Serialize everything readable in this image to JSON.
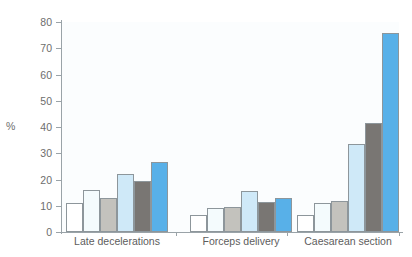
{
  "chart_data": {
    "type": "bar",
    "title": "",
    "subtitle": "",
    "xlabel": "",
    "ylabel": "%",
    "ylim": [
      0,
      80
    ],
    "yticks": [
      0,
      10,
      20,
      30,
      40,
      50,
      60,
      70,
      80
    ],
    "ytick_labels": [
      "0",
      "10",
      "20",
      "30",
      "40",
      "50",
      "60",
      "70",
      "80"
    ],
    "grid": false,
    "legend": "none",
    "categories": [
      "Late decelerations",
      "Forceps delivery",
      "Caesarean section"
    ],
    "series": [
      {
        "name": "series-1",
        "color": "#ffffff",
        "values": [
          11.0,
          6.5,
          6.5
        ]
      },
      {
        "name": "series-2",
        "color": "#f4fbfd",
        "values": [
          16.0,
          9.0,
          11.0
        ]
      },
      {
        "name": "series-3",
        "color": "#c3c2bd",
        "values": [
          13.0,
          9.5,
          12.0
        ]
      },
      {
        "name": "series-4",
        "color": "#cfe9f8",
        "values": [
          22.0,
          15.5,
          33.5
        ]
      },
      {
        "name": "series-5",
        "color": "#797673",
        "values": [
          19.5,
          11.5,
          41.5
        ]
      },
      {
        "name": "series-6",
        "color": "#58b0e8",
        "values": [
          26.5,
          13.0,
          76.0
        ]
      }
    ],
    "colors": {
      "axis": "#9aa3a8",
      "tick_text": "#6d6d6d",
      "label_text": "#5d5d5d",
      "bar_outline": "#8d969b",
      "plot_background": "#fbfdfe",
      "accent_blue": "#58b0e8"
    }
  }
}
